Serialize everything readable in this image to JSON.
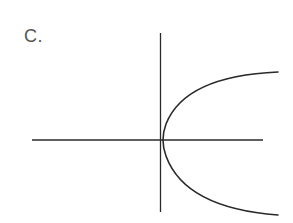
{
  "option": {
    "label": "C."
  },
  "diagram": {
    "colors": {
      "axis": "#2a2a2a",
      "curve": "#2a2a2a",
      "label": "#555555",
      "background": "#ffffff"
    },
    "axes": {
      "x_axis": {
        "x1": 32,
        "y1": 140,
        "x2": 263,
        "y2": 140
      },
      "y_axis": {
        "x1": 160.5,
        "y1": 33,
        "x2": 160.5,
        "y2": 212
      }
    },
    "curve": {
      "type": "parabola",
      "orientation": "opens-right",
      "vertex": [
        162,
        140
      ],
      "top_end": [
        278,
        72
      ],
      "bottom_end": [
        278,
        215
      ]
    }
  }
}
